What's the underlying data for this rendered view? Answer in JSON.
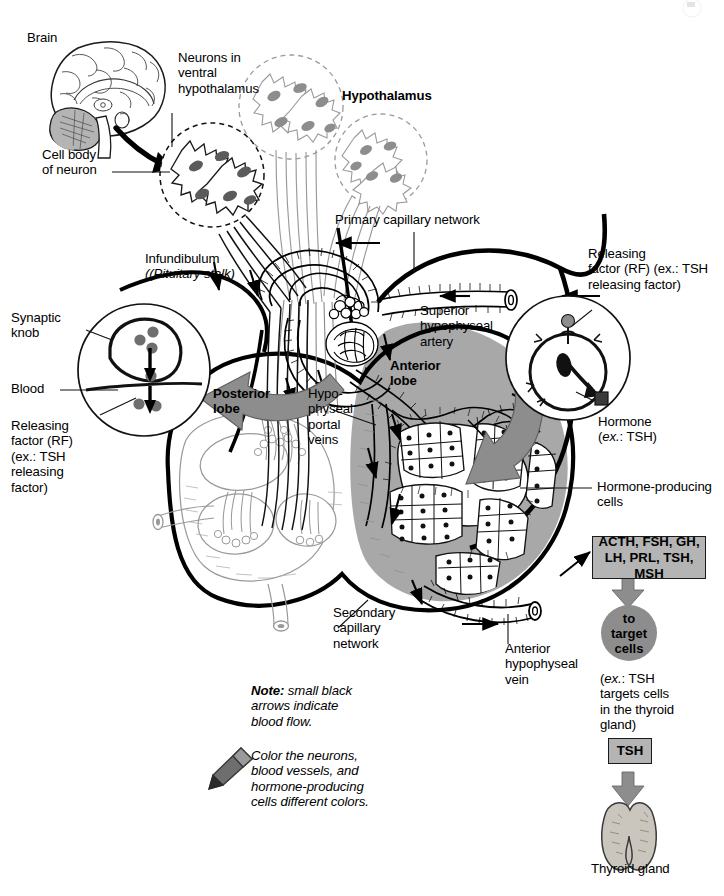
{
  "diagram": {
    "colors": {
      "ink": "#000000",
      "anterior_lobe_fill": "#a8a8a8",
      "gray_arrow": "#8d8d8d",
      "box_fill": "#b4b4b4",
      "circle_fill": "#8d8d8d",
      "light_structure": "#9a9a9a",
      "vesicle_dot": "#7a7a7a",
      "background": "#ffffff"
    }
  },
  "labels": {
    "brain": "Brain",
    "neurons_ventral": "Neurons in\nventral\nhypothalamus",
    "cell_body": "Cell body\nof neuron",
    "hypothalamus": "Hypothalamus",
    "primary_capillary": "Primary capillary network",
    "infundibulum": "Infundibulum",
    "infundibulum_sub": "(Pituitary stalk)",
    "releasing_factor_right": "Releasing\nfactor (RF) (ex.: TSH\nreleasing factor)",
    "superior_artery": "Superior\nhypophyseal\nartery",
    "synaptic_knob": "Synaptic\nknob",
    "blood": "Blood",
    "releasing_factor_left": "Releasing\nfactor (RF)\n(ex.: TSH\nreleasing\nfactor)",
    "posterior_lobe": "Posterior\nlobe",
    "anterior_lobe": "Anterior\nlobe",
    "hypophyseal_portal_veins": "Hypo-\nphyseal\nportal\nveins",
    "hormone": "Hormone",
    "hormone_sub": "(ex.: TSH)",
    "hormone_producing_cells": "Hormone-producing\ncells",
    "secondary_capillary": "Secondary\ncapillary\nnetwork",
    "anterior_vein": "Anterior\nhypophyseal\nvein",
    "thyroid_gland": "Thyroid gland"
  },
  "boxes": {
    "hormone_list": "ACTH, FSH, GH,\nLH, PRL, TSH, MSH",
    "target_cells": "to\ntarget\ncells",
    "target_note": "(ex.: TSH\ntargets cells\nin the thyroid\ngland)",
    "tsh": "TSH"
  },
  "notes": {
    "note_label": "Note:",
    "note_text": " small black\narrows indicate\nblood flow.",
    "color_instruction": "Color the neurons,\nblood vessels, and\nhormone-producing\ncells different colors."
  },
  "icons": {
    "crayon": "crayon-icon",
    "brain": "brain-icon",
    "thyroid": "thyroid-icon"
  }
}
